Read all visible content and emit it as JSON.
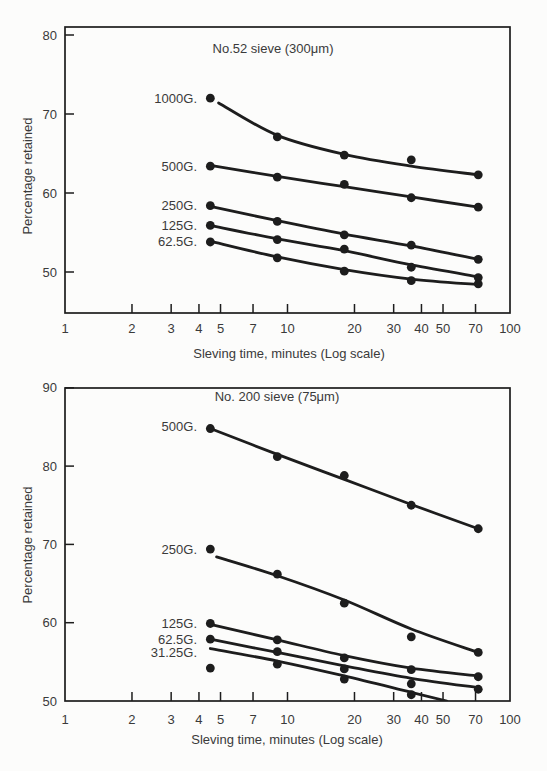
{
  "figure": {
    "kind": "two stacked log-scale scatter charts with fitted curves",
    "background_color": "#fcfcfb",
    "ink_color": "#1d1d1d",
    "text_color": "#3a3a3a"
  },
  "chart_data": [
    {
      "type": "scatter",
      "title": "No.52 sieve (300μm)",
      "xlabel": "Sleving time, minutes (Log scale)",
      "ylabel": "Percentage retained",
      "x_scale": "log",
      "xlim": [
        1,
        100
      ],
      "ylim": [
        44.8,
        81.0
      ],
      "x_ticks": [
        1,
        2,
        3,
        4,
        5,
        7,
        10,
        20,
        30,
        40,
        50,
        70,
        100
      ],
      "y_ticks": [
        50,
        60,
        70,
        80
      ],
      "grid": false,
      "legend_position": "inline labels left of first data points",
      "x": [
        4.5,
        9,
        18,
        36,
        72
      ],
      "series": [
        {
          "name": "1000G.",
          "label_v": 72.0,
          "points": [
            [
              4.5,
              72.0
            ],
            [
              9,
              67.1
            ],
            [
              18,
              64.8
            ],
            [
              36,
              64.2
            ],
            [
              72,
              62.3
            ]
          ],
          "fit_line": [
            [
              4.9,
              71.4
            ],
            [
              9,
              67.3
            ],
            [
              18,
              64.9
            ],
            [
              36,
              63.4
            ],
            [
              72,
              62.3
            ]
          ]
        },
        {
          "name": "500G.",
          "label_v": 63.4,
          "points": [
            [
              4.5,
              63.4
            ],
            [
              9,
              62.0
            ],
            [
              18,
              61.1
            ],
            [
              36,
              59.4
            ],
            [
              72,
              58.2
            ]
          ],
          "fit_line": [
            [
              4.5,
              63.5
            ],
            [
              9,
              62.1
            ],
            [
              18,
              60.8
            ],
            [
              36,
              59.5
            ],
            [
              72,
              58.2
            ]
          ]
        },
        {
          "name": "250G.",
          "label_v": 58.4,
          "points": [
            [
              4.5,
              58.4
            ],
            [
              9,
              56.4
            ],
            [
              18,
              54.7
            ],
            [
              36,
              53.4
            ],
            [
              72,
              51.6
            ]
          ],
          "fit_line": [
            [
              4.5,
              58.3
            ],
            [
              9,
              56.5
            ],
            [
              18,
              54.8
            ],
            [
              36,
              53.3
            ],
            [
              72,
              51.6
            ]
          ]
        },
        {
          "name": "125G.",
          "label_v": 55.9,
          "points": [
            [
              4.5,
              55.9
            ],
            [
              9,
              54.1
            ],
            [
              18,
              52.9
            ],
            [
              36,
              50.6
            ],
            [
              72,
              49.3
            ]
          ],
          "fit_line": [
            [
              4.5,
              55.9
            ],
            [
              9,
              54.2
            ],
            [
              18,
              52.7
            ],
            [
              36,
              50.9
            ],
            [
              72,
              49.4
            ]
          ]
        },
        {
          "name": "62.5G.",
          "label_v": 53.8,
          "points": [
            [
              4.5,
              53.8
            ],
            [
              9,
              51.8
            ],
            [
              18,
              50.1
            ],
            [
              36,
              48.9
            ],
            [
              72,
              48.5
            ]
          ],
          "fit_line": [
            [
              4.5,
              53.9
            ],
            [
              9,
              51.9
            ],
            [
              18,
              50.3
            ],
            [
              36,
              49.1
            ],
            [
              72,
              48.4
            ]
          ]
        }
      ]
    },
    {
      "type": "scatter",
      "title": "No. 200 sieve (75μm)",
      "xlabel": "Sleving time, minutes (Log scale)",
      "ylabel": "Percentage retained",
      "x_scale": "log",
      "xlim": [
        1,
        100
      ],
      "ylim": [
        50,
        90
      ],
      "x_ticks": [
        1,
        2,
        3,
        4,
        5,
        7,
        10,
        20,
        30,
        40,
        50,
        70,
        100
      ],
      "y_ticks": [
        50,
        60,
        70,
        80,
        90
      ],
      "grid": false,
      "legend_position": "inline labels left of first data points",
      "x": [
        4.5,
        9,
        18,
        36,
        72
      ],
      "series": [
        {
          "name": "500G.",
          "label_v": 85.0,
          "points": [
            [
              4.5,
              84.8
            ],
            [
              9,
              81.2
            ],
            [
              18,
              78.8
            ],
            [
              36,
              75.0
            ],
            [
              72,
              72.0
            ]
          ],
          "fit_line": [
            [
              4.5,
              84.8
            ],
            [
              9,
              81.5
            ],
            [
              18,
              78.3
            ],
            [
              36,
              75.1
            ],
            [
              72,
              72.0
            ]
          ]
        },
        {
          "name": "250G.",
          "label_v": 69.3,
          "points": [
            [
              4.5,
              69.4
            ],
            [
              9,
              66.2
            ],
            [
              18,
              62.5
            ],
            [
              36,
              58.2
            ],
            [
              72,
              56.2
            ]
          ],
          "fit_line": [
            [
              4.8,
              68.4
            ],
            [
              9,
              66.0
            ],
            [
              18,
              62.9
            ],
            [
              36,
              59.2
            ],
            [
              72,
              56.2
            ]
          ]
        },
        {
          "name": "125G.",
          "label_v": 59.9,
          "points": [
            [
              4.5,
              59.9
            ],
            [
              9,
              57.8
            ],
            [
              18,
              55.5
            ],
            [
              36,
              54.0
            ],
            [
              72,
              53.1
            ]
          ],
          "fit_line": [
            [
              4.5,
              59.8
            ],
            [
              9,
              57.8
            ],
            [
              18,
              55.8
            ],
            [
              36,
              54.2
            ],
            [
              72,
              53.2
            ]
          ]
        },
        {
          "name": "62.5G.",
          "label_v": 57.9,
          "points": [
            [
              4.5,
              57.9
            ],
            [
              9,
              56.3
            ],
            [
              18,
              54.1
            ],
            [
              36,
              52.2
            ],
            [
              72,
              51.5
            ]
          ],
          "fit_line": [
            [
              4.5,
              57.9
            ],
            [
              9,
              56.2
            ],
            [
              18,
              54.5
            ],
            [
              36,
              52.9
            ],
            [
              72,
              51.7
            ]
          ]
        },
        {
          "name": "31.25G.",
          "label_v": 56.2,
          "points": [
            [
              4.5,
              54.2
            ],
            [
              9,
              54.7
            ],
            [
              18,
              52.8
            ],
            [
              36,
              50.8
            ]
          ],
          "fit_line": [
            [
              4.5,
              56.7
            ],
            [
              9,
              55.1
            ],
            [
              18,
              53.2
            ],
            [
              36,
              51.1
            ],
            [
              52,
              50.0
            ]
          ]
        }
      ]
    }
  ]
}
